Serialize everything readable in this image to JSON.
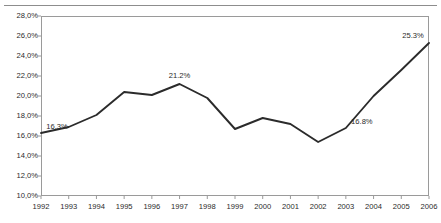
{
  "chart_data": {
    "type": "line",
    "title": "",
    "xlabel": "",
    "ylabel": "",
    "categories": [
      "1992",
      "1993",
      "1994",
      "1995",
      "1996",
      "1997",
      "1998",
      "1999",
      "2000",
      "2001",
      "2002",
      "2003",
      "2004",
      "2005",
      "2006"
    ],
    "values": [
      16.3,
      16.9,
      18.1,
      20.4,
      20.1,
      21.2,
      19.8,
      16.7,
      17.8,
      17.2,
      15.4,
      16.8,
      20.0,
      22.6,
      25.3
    ],
    "ylim": [
      10.0,
      28.0
    ],
    "ytick_labels": [
      "28,0%",
      "26,0%",
      "24,0%",
      "22,0%",
      "20,0%",
      "18,0%",
      "16,0%",
      "14,0%",
      "12,0%",
      "10,0%"
    ],
    "ytick_values": [
      28.0,
      26.0,
      24.0,
      22.0,
      20.0,
      18.0,
      16.0,
      14.0,
      12.0,
      10.0
    ],
    "grid": false,
    "legend": "none",
    "line_color": "#2b2b2b",
    "point_labels": [
      {
        "category": "1992",
        "value": 16.3,
        "text": "16.3%",
        "position": "above-right"
      },
      {
        "category": "1997",
        "value": 21.2,
        "text": "21.2%",
        "position": "above"
      },
      {
        "category": "2003",
        "value": 16.8,
        "text": "16.8%",
        "position": "above-right"
      },
      {
        "category": "2006",
        "value": 25.3,
        "text": "25.3%",
        "position": "above-left"
      }
    ]
  },
  "axis": {
    "y_ticks": [
      {
        "label": "28,0%"
      },
      {
        "label": "26,0%"
      },
      {
        "label": "24,0%"
      },
      {
        "label": "22,0%"
      },
      {
        "label": "20,0%"
      },
      {
        "label": "18,0%"
      },
      {
        "label": "16,0%"
      },
      {
        "label": "14,0%"
      },
      {
        "label": "12,0%"
      },
      {
        "label": "10,0%"
      }
    ],
    "x_ticks": [
      {
        "label": "1992"
      },
      {
        "label": "1993"
      },
      {
        "label": "1994"
      },
      {
        "label": "1995"
      },
      {
        "label": "1996"
      },
      {
        "label": "1997"
      },
      {
        "label": "1998"
      },
      {
        "label": "1999"
      },
      {
        "label": "2000"
      },
      {
        "label": "2001"
      },
      {
        "label": "2002"
      },
      {
        "label": "2003"
      },
      {
        "label": "2004"
      },
      {
        "label": "2005"
      },
      {
        "label": "2006"
      }
    ]
  }
}
